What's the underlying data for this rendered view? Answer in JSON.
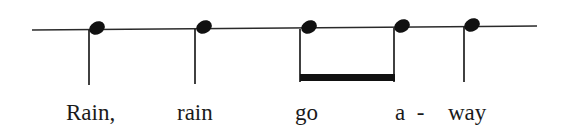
{
  "figure": {
    "type": "rhythm-notation",
    "staff": {
      "x1": 32,
      "y1": 30,
      "x2": 537,
      "y2": 26,
      "color": "#2a2a2a"
    },
    "ink_color": "#111111",
    "notes": [
      {
        "id": "rain1",
        "head_x": 97,
        "head_y": 28,
        "stem_x": 89,
        "stem_bottom": 85,
        "beamed": false
      },
      {
        "id": "rain2",
        "head_x": 204,
        "head_y": 27,
        "stem_x": 195,
        "stem_bottom": 84,
        "beamed": false
      },
      {
        "id": "go",
        "head_x": 309,
        "head_y": 27,
        "stem_x": 300,
        "stem_bottom": 82,
        "beamed": true
      },
      {
        "id": "a",
        "head_x": 402,
        "head_y": 26,
        "stem_x": 394,
        "stem_bottom": 82,
        "beamed": true
      },
      {
        "id": "way",
        "head_x": 472,
        "head_y": 25,
        "stem_x": 464,
        "stem_bottom": 82,
        "beamed": false
      }
    ],
    "beam": {
      "x1": 300,
      "x2": 395,
      "y": 74,
      "thickness": 7
    }
  },
  "lyrics": [
    {
      "text": "Rain,",
      "x": 66,
      "y": 101
    },
    {
      "text": "rain",
      "x": 177,
      "y": 101
    },
    {
      "text": "go",
      "x": 295,
      "y": 101
    },
    {
      "text": "a  -",
      "x": 395,
      "y": 101
    },
    {
      "text": "way",
      "x": 448,
      "y": 101
    }
  ]
}
